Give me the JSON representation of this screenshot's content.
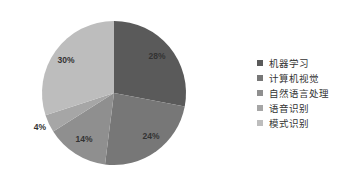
{
  "chart_data": {
    "type": "pie",
    "title": "",
    "categories": [
      "机器学习",
      "计算机视觉",
      "自然语言处理",
      "语音识别",
      "模式识别"
    ],
    "values": [
      28,
      24,
      14,
      4,
      30
    ],
    "labels": [
      "28%",
      "24%",
      "14%",
      "4%",
      "30%"
    ],
    "colors": [
      "#5a5a5a",
      "#777777",
      "#8f8f8f",
      "#a6a6a6",
      "#bdbdbd"
    ],
    "legend_position": "right",
    "start_angle": "12 o'clock",
    "direction": "clockwise"
  }
}
